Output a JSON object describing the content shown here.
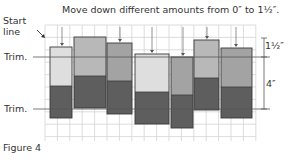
{
  "figure": {
    "title": "Move down different amounts from 0″ to 1½″.",
    "caption": "Figure 4",
    "start_label_line1": "Start",
    "start_label_line2": "line",
    "trim_top_label": "Trim.",
    "trim_bottom_label": "Trim.",
    "dim_top_label": "1½″",
    "dim_bottom_label": "4″"
  },
  "colors": {
    "grid": "#d4d4d4",
    "strip_light": "#dedede",
    "strip_medium": "#b8b8b8",
    "strip_mediumdark": "#a3a3a3",
    "strip_dark": "#5e5e5e",
    "outline": "#3a3a3a",
    "trim_line": "#555555"
  },
  "strips": [
    {
      "x": 50,
      "w": 22,
      "top": 47,
      "split": 86,
      "bottom": 118,
      "top_color": "strip_light"
    },
    {
      "x": 74,
      "w": 32,
      "top": 37,
      "split": 76,
      "bottom": 108,
      "top_color": "strip_medium"
    },
    {
      "x": 107,
      "w": 25,
      "top": 43,
      "split": 81,
      "bottom": 114,
      "top_color": "strip_mediumdark"
    },
    {
      "x": 135,
      "w": 34,
      "top": 54,
      "split": 92,
      "bottom": 124,
      "top_color": "strip_light"
    },
    {
      "x": 171,
      "w": 22,
      "top": 57,
      "split": 95,
      "bottom": 128,
      "top_color": "strip_mediumdark"
    },
    {
      "x": 194,
      "w": 25,
      "top": 40,
      "split": 78,
      "bottom": 110,
      "top_color": "strip_medium"
    },
    {
      "x": 221,
      "w": 31,
      "top": 48,
      "split": 87,
      "bottom": 118,
      "top_color": "strip_mediumdark"
    }
  ],
  "grid": {
    "x0": 45,
    "x1": 256,
    "y0": 25,
    "y1": 141,
    "step": 12.4
  },
  "trim_lines": {
    "top_y": 57,
    "bottom_y": 109
  },
  "arrows": [
    {
      "x": 62,
      "to": 46
    },
    {
      "x": 120,
      "to": 42
    },
    {
      "x": 152,
      "to": 53
    },
    {
      "x": 183,
      "to": 56
    },
    {
      "x": 207,
      "to": 39
    },
    {
      "x": 236,
      "to": 47
    }
  ]
}
